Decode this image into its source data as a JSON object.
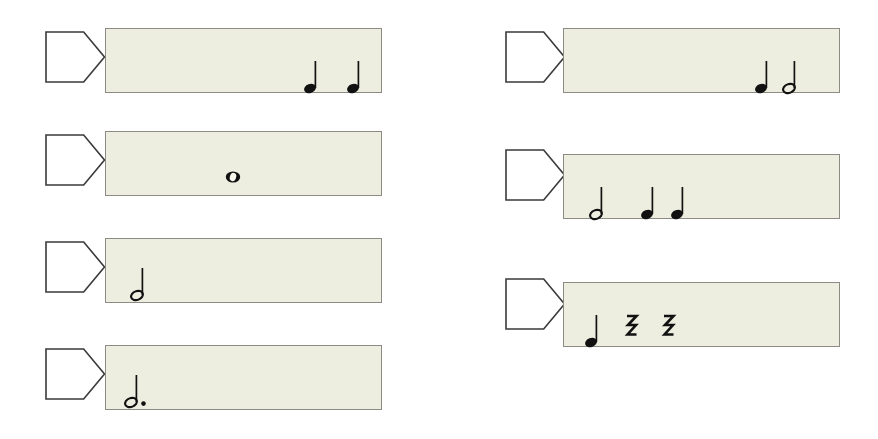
{
  "page": {
    "background_color": "#ffffff",
    "panel_fill_color": "#eeeee0",
    "panel_border_color": "#8c8c85",
    "marker_stroke_color": "#3a3a3a",
    "note_color": "#111111",
    "width": 878,
    "height": 439
  },
  "legend": {
    "quarter_note": "quarter-note",
    "half_note": "half-note",
    "whole_note": "whole-note",
    "dotted_half_note": "dotted-half-note",
    "quarter_rest": "quarter-rest"
  },
  "columns": [
    {
      "name": "left-column",
      "rows": [
        {
          "id": "row-1",
          "marker_label": "",
          "measure": {
            "x": 105,
            "y": 28,
            "width": 277,
            "height": 65
          },
          "marker": {
            "x": 44,
            "y": 30,
            "width": 62,
            "height": 54
          },
          "symbols": [
            {
              "type": "quarter-note",
              "x": 205,
              "y": 48,
              "label": "quarter note"
            },
            {
              "type": "quarter-note",
              "x": 248,
              "y": 48,
              "label": "quarter note"
            }
          ]
        },
        {
          "id": "row-2",
          "marker_label": "",
          "measure": {
            "x": 105,
            "y": 131,
            "width": 277,
            "height": 65
          },
          "marker": {
            "x": 44,
            "y": 133,
            "width": 62,
            "height": 54
          },
          "symbols": [
            {
              "type": "whole-note",
              "x": 127,
              "y": 45,
              "label": "whole note"
            }
          ]
        },
        {
          "id": "row-3",
          "marker_label": "",
          "measure": {
            "x": 105,
            "y": 238,
            "width": 277,
            "height": 65
          },
          "marker": {
            "x": 44,
            "y": 240,
            "width": 62,
            "height": 54
          },
          "symbols": [
            {
              "type": "half-note",
              "x": 32,
              "y": 45,
              "label": "half note"
            }
          ]
        },
        {
          "id": "row-4",
          "marker_label": "",
          "measure": {
            "x": 105,
            "y": 345,
            "width": 277,
            "height": 65
          },
          "marker": {
            "x": 44,
            "y": 347,
            "width": 62,
            "height": 54
          },
          "symbols": [
            {
              "type": "dotted-half-note",
              "x": 30,
              "y": 45,
              "label": "dotted half note"
            }
          ]
        }
      ]
    },
    {
      "name": "right-column",
      "rows": [
        {
          "id": "row-5",
          "marker_label": "",
          "measure": {
            "x": 563,
            "y": 28,
            "width": 277,
            "height": 65
          },
          "marker": {
            "x": 504,
            "y": 30,
            "width": 62,
            "height": 54
          },
          "symbols": [
            {
              "type": "quarter-note",
              "x": 198,
              "y": 48,
              "label": "quarter note"
            },
            {
              "type": "half-note",
              "x": 226,
              "y": 48,
              "label": "half note"
            }
          ]
        },
        {
          "id": "row-6",
          "marker_label": "",
          "measure": {
            "x": 563,
            "y": 154,
            "width": 277,
            "height": 65
          },
          "marker": {
            "x": 504,
            "y": 148,
            "width": 62,
            "height": 54
          },
          "symbols": [
            {
              "type": "half-note",
              "x": 33,
              "y": 48,
              "label": "half note"
            },
            {
              "type": "quarter-note",
              "x": 84,
              "y": 48,
              "label": "quarter note"
            },
            {
              "type": "quarter-note",
              "x": 114,
              "y": 48,
              "label": "quarter note"
            }
          ]
        },
        {
          "id": "row-7",
          "marker_label": "",
          "measure": {
            "x": 563,
            "y": 282,
            "width": 277,
            "height": 65
          },
          "marker": {
            "x": 504,
            "y": 277,
            "width": 62,
            "height": 54
          },
          "symbols": [
            {
              "type": "quarter-note",
              "x": 28,
              "y": 48,
              "label": "quarter note"
            },
            {
              "type": "quarter-rest",
              "x": 68,
              "y": 44,
              "label": "quarter rest"
            },
            {
              "type": "quarter-rest",
              "x": 105,
              "y": 44,
              "label": "quarter rest"
            }
          ]
        }
      ]
    }
  ]
}
